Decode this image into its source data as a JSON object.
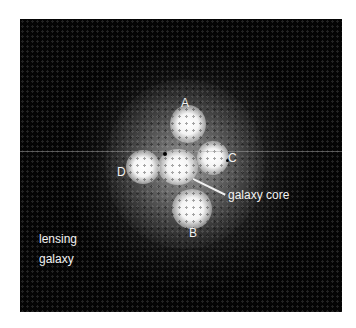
{
  "figure": {
    "labels": {
      "image_a": "A",
      "image_b": "B",
      "image_c": "C",
      "image_d": "D",
      "core": "galaxy core",
      "lensing_line1": "lensing",
      "lensing_line2": "galaxy"
    },
    "colors": {
      "background": "#050505",
      "page": "#ffffff",
      "text": "#f2f2f2"
    }
  }
}
